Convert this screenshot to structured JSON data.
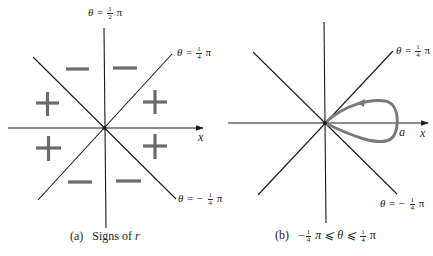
{
  "panel_a": {
    "caption_prefix": "(a)",
    "caption_text": "Signs of",
    "caption_var": "r",
    "axis_label": "x",
    "labels": {
      "theta_half_pi": {
        "lhs": "θ =",
        "num": "1",
        "den": "2",
        "rhs": "π"
      },
      "theta_quarter_pi": {
        "lhs": "θ =",
        "num": "1",
        "den": "4",
        "rhs": "π"
      },
      "theta_neg_quarter_pi": {
        "lhs": "θ = −",
        "num": "1",
        "den": "4",
        "rhs": "π"
      }
    },
    "signs": {
      "upper_left": "−",
      "upper_right": "−",
      "left_upper": "+",
      "right_upper": "+",
      "left_lower": "+",
      "right_lower": "+",
      "lower_left": "−",
      "lower_right": "−"
    },
    "sign_color": "#6b6b6b"
  },
  "panel_b": {
    "caption_prefix": "(b)",
    "caption_lhs": "−",
    "caption_num1": "1",
    "caption_den1": "4",
    "caption_mid": "π ⩽ θ ⩽",
    "caption_num2": "1",
    "caption_den2": "4",
    "caption_rhs": "π",
    "axis_label": "x",
    "loop_label": "a",
    "labels": {
      "theta_quarter_pi": {
        "lhs": "θ =",
        "num": "1",
        "den": "4",
        "rhs": "π"
      },
      "theta_neg_quarter_pi": {
        "lhs": "θ = −",
        "num": "1",
        "den": "4",
        "rhs": "π"
      }
    },
    "curve_color": "#7a7a7a"
  },
  "line_color": "#1a1a1a"
}
